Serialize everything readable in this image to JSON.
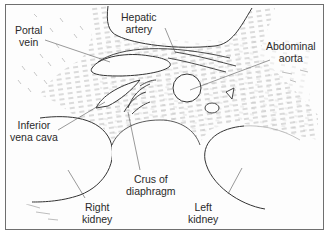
{
  "diagram": {
    "type": "anatomical cross-section line drawing",
    "labels": [
      {
        "id": "portal-vein",
        "lines": [
          "Portal",
          "vein"
        ]
      },
      {
        "id": "hepatic-artery",
        "lines": [
          "Hepatic",
          "artery"
        ]
      },
      {
        "id": "abdominal-aorta",
        "lines": [
          "Abdominal",
          "aorta"
        ]
      },
      {
        "id": "inferior-vena-cava",
        "lines": [
          "Inferior",
          "vena cava"
        ]
      },
      {
        "id": "crus-of-diaphragm",
        "lines": [
          "Crus of",
          "diaphragm"
        ]
      },
      {
        "id": "right-kidney",
        "lines": [
          "Right",
          "kidney"
        ]
      },
      {
        "id": "left-kidney",
        "lines": [
          "Left",
          "kidney"
        ]
      }
    ],
    "colors": {
      "background": "#ffffff",
      "line": "#333333",
      "hatch": "#8a8a8a",
      "frame": "#6f6f6f",
      "text": "#2a2a2a"
    }
  }
}
